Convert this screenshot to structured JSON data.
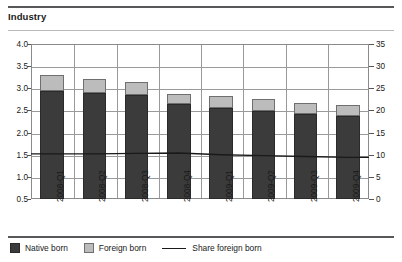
{
  "header": {
    "title": "Industry"
  },
  "legend": {
    "items": [
      {
        "label": "Native born",
        "swatch": "square-dark",
        "color": "#3b3b3b"
      },
      {
        "label": "Foreign born",
        "swatch": "square-light",
        "color": "#bcbcbc"
      },
      {
        "label": "Share foreign born",
        "swatch": "line",
        "color": "#1a1a1a"
      }
    ]
  },
  "chart_data": {
    "type": "bar",
    "title": "Industry",
    "xlabel": "",
    "ylabel": "",
    "stacked": true,
    "grid": true,
    "legend_position": "bottom",
    "categories": [
      "2008-Q1",
      "2008-Q2",
      "2008-Q3",
      "2008-Q4",
      "2009-Q1",
      "2009-Q2",
      "2009-Q3",
      "2009-Q4"
    ],
    "left_axis": {
      "ticks": [
        "0.5",
        "1.0",
        "1.5",
        "2.0",
        "2.5",
        "3.0",
        "3.5",
        "4.0"
      ],
      "ylim": [
        0.5,
        4.0
      ],
      "unit": "millions"
    },
    "right_axis": {
      "ticks": [
        "0",
        "5",
        "10",
        "15",
        "20",
        "25",
        "30",
        "35"
      ],
      "ylim": [
        0,
        35
      ],
      "unit": "percent"
    },
    "series": [
      {
        "name": "Native born",
        "axis": "left",
        "type": "bar",
        "color": "#3b3b3b",
        "values": [
          2.95,
          2.9,
          2.85,
          2.65,
          2.55,
          2.48,
          2.42,
          2.37
        ]
      },
      {
        "name": "Foreign born",
        "axis": "left",
        "type": "bar",
        "color": "#bcbcbc",
        "values": [
          0.35,
          0.32,
          0.3,
          0.22,
          0.28,
          0.27,
          0.25,
          0.25
        ]
      },
      {
        "name": "Share foreign born",
        "axis": "right",
        "type": "line",
        "color": "#1a1a1a",
        "values": [
          10.2,
          10.2,
          10.3,
          10.4,
          10.0,
          9.8,
          9.6,
          9.4
        ]
      }
    ],
    "totals": [
      3.3,
      3.22,
      3.15,
      2.87,
      2.83,
      2.75,
      2.67,
      2.62
    ]
  }
}
